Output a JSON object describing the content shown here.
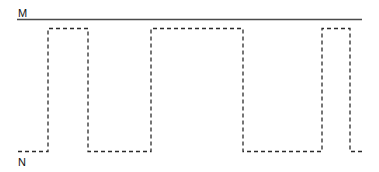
{
  "figure": {
    "width": 379,
    "height": 172,
    "background_color": "#ffffff"
  },
  "labels": {
    "upper": "M",
    "lower": "N"
  },
  "colors": {
    "solid_line": "#4a4a4a",
    "dashed_wave": "#2b2b2b",
    "label_text": "#111111"
  },
  "reference_line": {
    "name": "M-reference-line",
    "style": "solid",
    "y": 19.5,
    "x_start": 17,
    "x_end": 362,
    "stroke_width": 1.5
  },
  "waveform": {
    "name": "dashed-square-wave",
    "style": "dashed",
    "dash_pattern": "4,3",
    "stroke_width": 1.3,
    "high_level_y": 28.5,
    "low_level_y": 151.5,
    "x_start": 18,
    "x_end": 365,
    "transitions": [
      48,
      88,
      151,
      243,
      322,
      350
    ],
    "levels": [
      "low",
      "high",
      "low",
      "high",
      "low",
      "high",
      "low"
    ],
    "path": "M 18 151.5 L 48 151.5 L 48 28.5 L 88 28.5 L 88 151.5 L 151 151.5 L 151 28.5 L 243 28.5 L 243 151.5 L 322 151.5 L 322 28.5 L 350 28.5 L 350 151.5 L 365 151.5"
  },
  "chart_data": {
    "type": "line",
    "title": "",
    "xlabel": "",
    "ylabel": "",
    "series": [
      {
        "name": "M",
        "style": "solid",
        "x": [
          17,
          362
        ],
        "y": [
          "M",
          "M"
        ]
      },
      {
        "name": "square-wave",
        "style": "dashed",
        "x": [
          18,
          48,
          48,
          88,
          88,
          151,
          151,
          243,
          243,
          322,
          322,
          350,
          350,
          365
        ],
        "y": [
          "N",
          "N",
          "M",
          "M",
          "N",
          "N",
          "M",
          "M",
          "N",
          "N",
          "M",
          "M",
          "N",
          "N"
        ]
      }
    ],
    "ytick_labels": [
      "M",
      "N"
    ],
    "ylim": [
      "N",
      "M"
    ],
    "xlim": [
      17,
      365
    ],
    "grid": false,
    "legend": "none"
  }
}
